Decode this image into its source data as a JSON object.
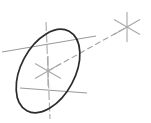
{
  "drawing": {
    "title": "Isometric circle with axis centerline",
    "background_color": "#ffffff",
    "width": 151,
    "height": 123,
    "stroke_colors": {
      "ellipse": "#2b2b2b",
      "centerline": "#9a9a9a",
      "axis_dashed": "#a2a2a2",
      "marker": "#a8a8a8"
    },
    "ellipse": {
      "label": "isometric-circle",
      "center_x": 48,
      "center_y": 71,
      "radius_x": 27,
      "radius_y": 45,
      "rotation_deg": 28
    },
    "circle_center_marker": {
      "label": "center-star-marker",
      "x": 48,
      "y": 71,
      "ray_count": 6
    },
    "axis_point_marker": {
      "label": "axis-point-star-marker",
      "x": 127,
      "y": 27,
      "ray_count": 6
    },
    "axis_line": {
      "label": "dashed-axis-line",
      "x1": 48,
      "y1": 71,
      "x2": 127,
      "y2": 27
    },
    "centerlines": [
      {
        "label": "vertical-centerline",
        "x1": 46,
        "y1": 22,
        "x2": 50,
        "y2": 119
      },
      {
        "label": "major-axis-centerline",
        "x1": 2,
        "y1": 52,
        "x2": 96,
        "y2": 36
      },
      {
        "label": "minor-axis-centerline",
        "x1": 20,
        "y1": 88,
        "x2": 87,
        "y2": 93
      }
    ]
  }
}
